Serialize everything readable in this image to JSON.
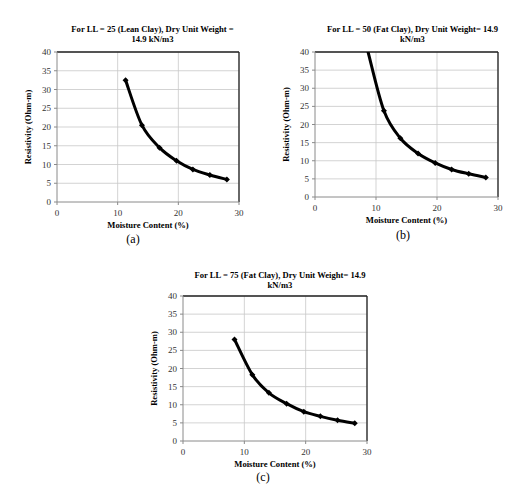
{
  "figure": {
    "captions": [
      "(a)",
      "(b)",
      "(c)"
    ]
  },
  "chart_data": [
    {
      "id": "a",
      "type": "line",
      "title": "For LL = 25 (Lean Clay), Dry Unit Weight = 14.9 kN/m3",
      "title_lines": [
        "For LL = 25 (Lean Clay), Dry Unit Weight =",
        "14.9 kN/m3"
      ],
      "xlabel": "Moisture Content (%)",
      "ylabel": "Resistivity (Ohm-m)",
      "xlim": [
        0,
        30
      ],
      "ylim": [
        0,
        40
      ],
      "xticks": [
        0,
        10,
        20,
        30
      ],
      "yticks": [
        0,
        5,
        10,
        15,
        20,
        25,
        30,
        35,
        40
      ],
      "grid": true,
      "legend": null,
      "caption": "(a)",
      "series": [
        {
          "name": "Resistivity",
          "x": [
            11.3,
            14.0,
            16.9,
            19.7,
            22.4,
            25.2,
            28.0
          ],
          "values": [
            32.5,
            20.5,
            14.5,
            11.0,
            8.7,
            7.2,
            6.0
          ],
          "curve_extension": null
        }
      ]
    },
    {
      "id": "b",
      "type": "line",
      "title": "For LL = 50 (Fat Clay), Dry Unit Weight= 14.9 kN/m3",
      "title_lines": [
        "For LL = 50 (Fat Clay), Dry Unit Weight= 14.9",
        "kN/m3"
      ],
      "xlabel": "Moisture Content (%)",
      "ylabel": "Resistivity (Ohm-m)",
      "xlim": [
        0,
        30
      ],
      "ylim": [
        0,
        40
      ],
      "xticks": [
        0,
        10,
        20,
        30
      ],
      "yticks": [
        0,
        5,
        10,
        15,
        20,
        25,
        30,
        35,
        40
      ],
      "grid": true,
      "legend": null,
      "caption": "(b)",
      "series": [
        {
          "name": "Resistivity",
          "x": [
            11.3,
            14.0,
            16.9,
            19.7,
            22.4,
            25.2,
            28.0
          ],
          "values": [
            23.8,
            16.2,
            12.0,
            9.4,
            7.6,
            6.4,
            5.4
          ],
          "curve_extension": {
            "x": 8.7,
            "y": 40,
            "note": "curve exits top of plot above 40"
          }
        }
      ]
    },
    {
      "id": "c",
      "type": "line",
      "title": "For LL = 75 (Fat Clay), Dry Unit Weight= 14.9 kN/m3",
      "title_lines": [
        "For LL = 75 (Fat Clay), Dry Unit Weight= 14.9",
        "kN/m3"
      ],
      "xlabel": "Moisture Content (%)",
      "ylabel": "Resistivity (Ohm-m)",
      "xlim": [
        0,
        30
      ],
      "ylim": [
        0,
        40
      ],
      "xticks": [
        0,
        10,
        20,
        30
      ],
      "yticks": [
        0,
        5,
        10,
        15,
        20,
        25,
        30,
        35,
        40
      ],
      "grid": true,
      "legend": null,
      "caption": "(c)",
      "series": [
        {
          "name": "Resistivity",
          "x": [
            8.4,
            11.3,
            14.0,
            16.9,
            19.7,
            22.4,
            25.2,
            28.0
          ],
          "values": [
            28.0,
            18.3,
            13.3,
            10.3,
            8.1,
            6.8,
            5.7,
            4.9
          ],
          "curve_extension": null
        }
      ]
    }
  ]
}
